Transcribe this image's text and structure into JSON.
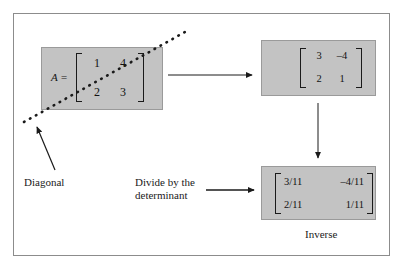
{
  "figure": {
    "matrix_a": {
      "label": "A =",
      "rows": [
        [
          "1",
          "4"
        ],
        [
          "2",
          "3"
        ]
      ]
    },
    "matrix_adjugate": {
      "rows": [
        [
          "3",
          "–4"
        ],
        [
          "2",
          "1"
        ]
      ]
    },
    "matrix_inverse": {
      "rows": [
        [
          "3/11",
          "–4/11"
        ],
        [
          "2/11",
          "1/11"
        ]
      ]
    },
    "annotations": {
      "diagonal": "Diagonal",
      "divide": "Divide by the\ndeterminant",
      "inverse": "Inverse"
    },
    "colors": {
      "box_fill": "#c3c3c3",
      "box_border": "#9a9a9a",
      "figure_border": "#8c8c8c",
      "ink": "#1a1a1a"
    }
  }
}
